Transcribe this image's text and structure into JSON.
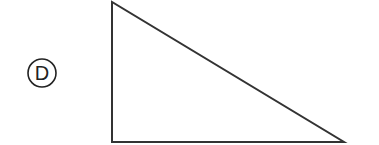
{
  "option": {
    "letter": "D",
    "circle": {
      "cx": 42,
      "cy": 73,
      "r": 14
    }
  },
  "diagram": {
    "shape": "right-triangle",
    "stroke_color": "#333333",
    "vertices": {
      "top": [
        112,
        2
      ],
      "bottom_left": [
        112,
        142
      ],
      "bottom_right": [
        344,
        142
      ]
    }
  }
}
